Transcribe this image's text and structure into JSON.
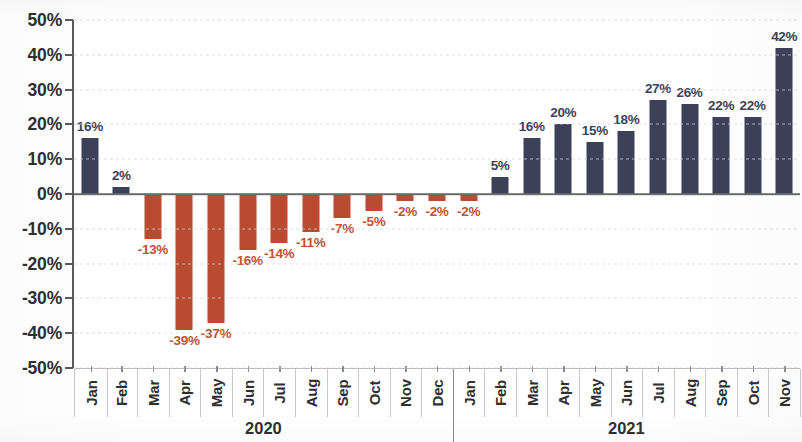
{
  "chart_data": {
    "type": "bar",
    "title": "",
    "subtitle": "",
    "xlabel": "",
    "ylabel": "",
    "ylim": [
      -50,
      50
    ],
    "ytick_step": 10,
    "grid": true,
    "legend": null,
    "value_labels": true,
    "value_label_suffix": "%",
    "categories": [
      "Jan",
      "Feb",
      "Mar",
      "Apr",
      "May",
      "Jun",
      "Jul",
      "Aug",
      "Sep",
      "Oct",
      "Nov",
      "Dec",
      "Jan",
      "Feb",
      "Mar",
      "Apr",
      "May",
      "Jun",
      "Jul",
      "Aug",
      "Sep",
      "Oct",
      "Nov"
    ],
    "values": [
      16,
      2,
      -13,
      -39,
      -37,
      -16,
      -14,
      -11,
      -7,
      -5,
      -2,
      -2,
      -2,
      5,
      16,
      20,
      15,
      18,
      27,
      26,
      22,
      22,
      42
    ],
    "data_labels": [
      "16%",
      "2%",
      "-13%",
      "-39%",
      "-37%",
      "-16%",
      "-14%",
      "-11%",
      "-7%",
      "-5%",
      "-2%",
      "-2%",
      "-2%",
      "5%",
      "16%",
      "20%",
      "15%",
      "18%",
      "27%",
      "26%",
      "22%",
      "22%",
      "42%"
    ],
    "ytick_labels": [
      "50%",
      "40%",
      "30%",
      "20%",
      "10%",
      "0%",
      "-10%",
      "-20%",
      "-30%",
      "-40%",
      "-50%"
    ],
    "ytick_values": [
      50,
      40,
      30,
      20,
      10,
      0,
      -10,
      -20,
      -30,
      -40,
      -50
    ],
    "groups": [
      {
        "label": "2020",
        "start": 0,
        "count": 12
      },
      {
        "label": "2021",
        "start": 12,
        "count": 11
      }
    ],
    "colors": {
      "positive": "#3c4159",
      "negative": "#b94b31",
      "positive_label": "#3c4159",
      "negative_label": "#c05334",
      "axis": "#5a5a5a",
      "gridline": "#cfd4dc",
      "tick_text": "#2f2f2f",
      "background": "#ffffff"
    }
  }
}
